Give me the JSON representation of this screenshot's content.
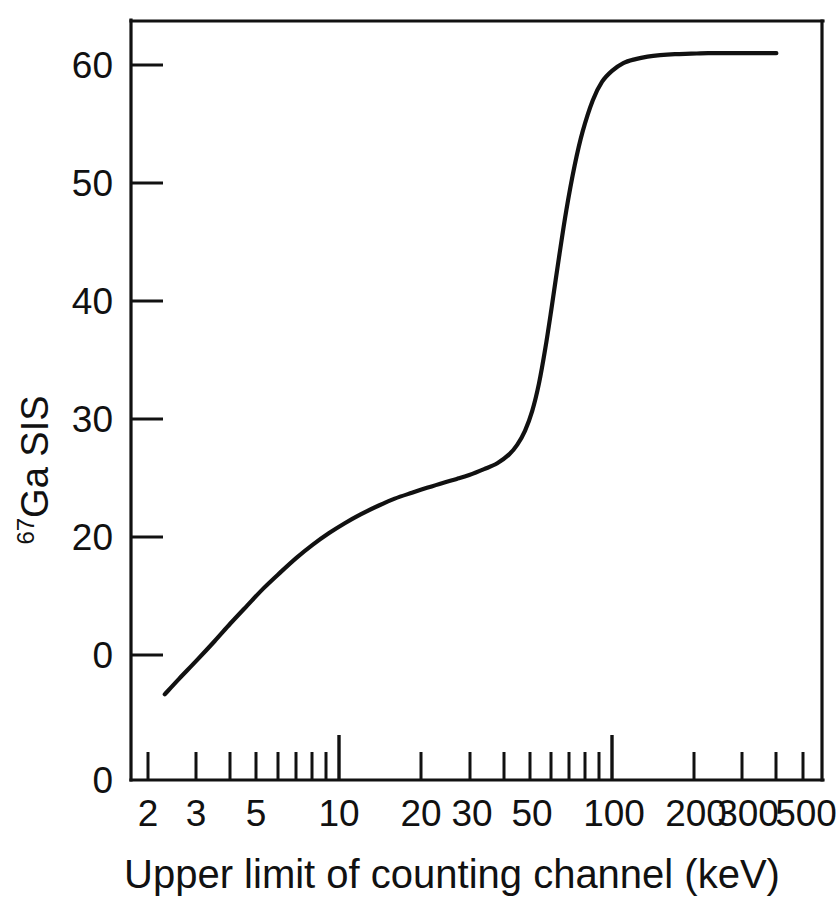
{
  "figure": {
    "background_color": "#ffffff",
    "ink_color": "#111111"
  },
  "chart_data": {
    "type": "line",
    "title": "",
    "subtitle": "",
    "xlabel": "Upper limit of counting channel (keV)",
    "ylabel": "67Ga SIS",
    "ylabel_superscript": "67",
    "ylabel_base": "Ga SIS",
    "xscale": "log",
    "yscale": "linear",
    "xlim": [
      2,
      600
    ],
    "ylim": [
      -8,
      65
    ],
    "grid": false,
    "legend": null,
    "legend_position": "none",
    "xticklabels": [
      "2",
      "3",
      "5",
      "10",
      "20",
      "30",
      "50",
      "100",
      "200",
      "300",
      "500"
    ],
    "xtickvalues": [
      2,
      3,
      5,
      10,
      20,
      30,
      50,
      100,
      200,
      300,
      500
    ],
    "xminorticks": [
      2,
      3,
      4,
      5,
      6,
      7,
      8,
      9,
      10,
      20,
      30,
      40,
      50,
      60,
      70,
      80,
      90,
      100,
      200,
      300,
      400,
      500,
      600
    ],
    "xmajorticks": [
      10,
      100
    ],
    "yticklabels": [
      "60",
      "50",
      "40",
      "30",
      "20",
      "0",
      "0"
    ],
    "ytickvalues": [
      60,
      50,
      40,
      30,
      20,
      10,
      0
    ],
    "series": [
      {
        "name": "67Ga SIS",
        "x": [
          2.3,
          2.6,
          3.0,
          3.5,
          4.0,
          4.6,
          5.3,
          6.1,
          7.0,
          8.0,
          9.2,
          10.5,
          12.0,
          14.0,
          16.0,
          18.5,
          21.0,
          24.0,
          27.0,
          30.0,
          34.0,
          38.0,
          42.0,
          45.0,
          48.0,
          51.0,
          54.0,
          57.0,
          60.0,
          64.0,
          68.0,
          73.0,
          78.0,
          85.0,
          92.0,
          100.0,
          110.0,
          122.0,
          135.0,
          150.0,
          170.0,
          195.0,
          225.0,
          260.0,
          300.0,
          345.0,
          400.0
        ],
        "y": [
          -4.0,
          -2.4,
          -0.6,
          1.4,
          3.2,
          5.0,
          6.8,
          8.4,
          9.9,
          11.2,
          12.4,
          13.4,
          14.3,
          15.2,
          15.9,
          16.5,
          17.0,
          17.5,
          17.9,
          18.3,
          18.9,
          19.5,
          20.4,
          21.4,
          22.8,
          24.8,
          27.6,
          31.2,
          35.2,
          40.5,
          45.2,
          49.8,
          53.2,
          56.4,
          58.3,
          59.4,
          60.2,
          60.6,
          60.85,
          61.0,
          61.1,
          61.15,
          61.2,
          61.2,
          61.2,
          61.2,
          61.2
        ]
      }
    ],
    "annotations": [],
    "notes": {
      "plateau_low_value": 18,
      "plateau_high_value": 61,
      "inflection_x_kev": 55,
      "start_point": {
        "x": 2.3,
        "y": -4
      },
      "end_point": {
        "x": 400,
        "y": 61
      }
    }
  }
}
